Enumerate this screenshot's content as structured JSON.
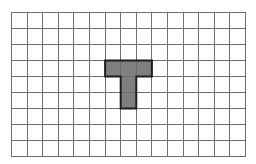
{
  "board": {
    "columns": 15,
    "rows": 9,
    "cell_width": 15.6,
    "cell_height": 16,
    "grid_line_color": "#6e6e6e",
    "empty_color": "#ffffff"
  },
  "piece": {
    "shape": "T",
    "fill_color": "#7f7f7f",
    "outline_color": "#1e1e1e",
    "cells": [
      [
        3,
        6
      ],
      [
        3,
        7
      ],
      [
        3,
        8
      ],
      [
        4,
        7
      ],
      [
        5,
        7
      ]
    ]
  }
}
